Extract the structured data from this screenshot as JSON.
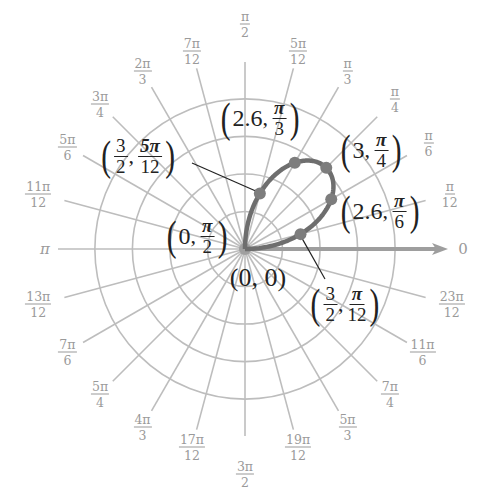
{
  "diagram": {
    "type": "polar-graph",
    "curve": "r = 3 sin(2θ)",
    "center_px": [
      245,
      249
    ],
    "px_per_unit": 38.3,
    "grid_rings": [
      1,
      2,
      3,
      4
    ],
    "radial_step_deg": 15,
    "colors": {
      "grid": "#bdbdbd",
      "axis": "#9e9e9e",
      "curve": "#6e6e6e",
      "point": "#7d7d7d",
      "label_gray": "#9a9a9a",
      "label_dark": "#222222"
    },
    "polar_axis_label": "0",
    "angle_labels": [
      {
        "id": "a0",
        "deg": 0,
        "num": "",
        "den": "",
        "single": "0"
      },
      {
        "id": "a15",
        "deg": 15,
        "num": "π",
        "den": "12"
      },
      {
        "id": "a30",
        "deg": 30,
        "num": "π",
        "den": "6"
      },
      {
        "id": "a45",
        "deg": 45,
        "num": "π",
        "den": "4"
      },
      {
        "id": "a60",
        "deg": 60,
        "num": "π",
        "den": "3"
      },
      {
        "id": "a75",
        "deg": 75,
        "num": "5π",
        "den": "12"
      },
      {
        "id": "a90",
        "deg": 90,
        "num": "π",
        "den": "2"
      },
      {
        "id": "a105",
        "deg": 105,
        "num": "7π",
        "den": "12"
      },
      {
        "id": "a120",
        "deg": 120,
        "num": "2π",
        "den": "3"
      },
      {
        "id": "a135",
        "deg": 135,
        "num": "3π",
        "den": "4"
      },
      {
        "id": "a150",
        "deg": 150,
        "num": "5π",
        "den": "6"
      },
      {
        "id": "a165",
        "deg": 165,
        "num": "11π",
        "den": "12"
      },
      {
        "id": "a180",
        "deg": 180,
        "num": "",
        "den": "",
        "single": "π"
      },
      {
        "id": "a195",
        "deg": 195,
        "num": "13π",
        "den": "12"
      },
      {
        "id": "a210",
        "deg": 210,
        "num": "7π",
        "den": "6"
      },
      {
        "id": "a225",
        "deg": 225,
        "num": "5π",
        "den": "4"
      },
      {
        "id": "a240",
        "deg": 240,
        "num": "4π",
        "den": "3"
      },
      {
        "id": "a255",
        "deg": 255,
        "num": "17π",
        "den": "12"
      },
      {
        "id": "a270",
        "deg": 270,
        "num": "3π",
        "den": "2"
      },
      {
        "id": "a285",
        "deg": 285,
        "num": "19π",
        "den": "12"
      },
      {
        "id": "a300",
        "deg": 300,
        "num": "5π",
        "den": "3"
      },
      {
        "id": "a315",
        "deg": 315,
        "num": "7π",
        "den": "4"
      },
      {
        "id": "a330",
        "deg": 330,
        "num": "11π",
        "den": "6"
      },
      {
        "id": "a345",
        "deg": 345,
        "num": "23π",
        "den": "12"
      }
    ],
    "points": [
      {
        "name": "origin",
        "r": 0,
        "theta_deg": 0,
        "label": {
          "r": "0",
          "theta": "0",
          "text": "(0, 0)"
        }
      },
      {
        "name": "p-pi-12",
        "r": 1.5,
        "theta_deg": 15,
        "label": {
          "r_num": "3",
          "r_den": "2",
          "theta_num": "π",
          "theta_den": "12"
        }
      },
      {
        "name": "p-pi-6",
        "r": 2.6,
        "theta_deg": 30,
        "label": {
          "r": "2.6",
          "theta_num": "π",
          "theta_den": "6"
        }
      },
      {
        "name": "p-pi-4",
        "r": 3,
        "theta_deg": 45,
        "label": {
          "r": "3",
          "theta_num": "π",
          "theta_den": "4"
        }
      },
      {
        "name": "p-pi-3",
        "r": 2.6,
        "theta_deg": 60,
        "label": {
          "r": "2.6",
          "theta_num": "π",
          "theta_den": "3"
        }
      },
      {
        "name": "p-5pi-12",
        "r": 1.5,
        "theta_deg": 75,
        "label": {
          "r_num": "3",
          "r_den": "2",
          "theta_num": "5π",
          "theta_den": "12"
        }
      },
      {
        "name": "p-pi-2",
        "r": 0,
        "theta_deg": 90,
        "label": {
          "r": "0",
          "theta_num": "π",
          "theta_den": "2"
        }
      }
    ]
  }
}
